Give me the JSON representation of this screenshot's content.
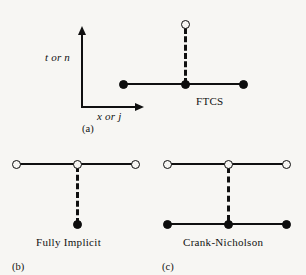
{
  "figure": {
    "background_color": "#f7f6f3",
    "ink_color": "#101010",
    "axes": {
      "y_label": "t or n",
      "x_label": "x or j"
    },
    "panels": [
      {
        "id": "a",
        "panel_label": "(a)",
        "scheme_label": "FTCS",
        "description": "forward-time centered-space stencil",
        "nodes": {
          "filled_row_y": 84,
          "filled_x": [
            123,
            185,
            243
          ],
          "open": [
            {
              "x": 185,
              "y": 24
            }
          ]
        }
      },
      {
        "id": "b",
        "panel_label": "(b)",
        "scheme_label": "Fully Implicit",
        "description": "backward-time centered-space stencil",
        "nodes": {
          "open_row_y": 164,
          "open_x": [
            16,
            77,
            135
          ],
          "filled": [
            {
              "x": 77,
              "y": 224
            }
          ]
        }
      },
      {
        "id": "c",
        "panel_label": "(c)",
        "scheme_label": "Crank-Nicholson",
        "description": "time-centered implicit stencil",
        "nodes": {
          "open_row_y": 164,
          "open_x": [
            167,
            228,
            286
          ],
          "filled_row_y": 224,
          "filled_x": [
            167,
            228,
            286
          ]
        }
      }
    ]
  }
}
